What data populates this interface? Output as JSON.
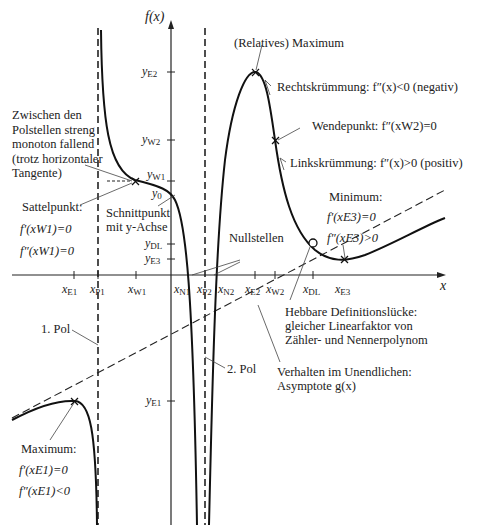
{
  "axes": {
    "y_axis_label": "f(x)",
    "x_axis_label": "x"
  },
  "y_ticks": [
    {
      "id": "yE2",
      "main": "y",
      "sub": "E2"
    },
    {
      "id": "yW2",
      "main": "y",
      "sub": "W2"
    },
    {
      "id": "yW1",
      "main": "y",
      "sub": "W1"
    },
    {
      "id": "y0",
      "main": "y",
      "sub": "0"
    },
    {
      "id": "yDL",
      "main": "y",
      "sub": "DL"
    },
    {
      "id": "yE3",
      "main": "y",
      "sub": "E3"
    },
    {
      "id": "yE1",
      "main": "y",
      "sub": "E1"
    }
  ],
  "x_ticks": [
    {
      "id": "xE1",
      "main": "x",
      "sub": "E1"
    },
    {
      "id": "xP1",
      "main": "x",
      "sub": "P1"
    },
    {
      "id": "xW1",
      "main": "x",
      "sub": "W1"
    },
    {
      "id": "xN1",
      "main": "x",
      "sub": "N1"
    },
    {
      "id": "xP2",
      "main": "x",
      "sub": "P2"
    },
    {
      "id": "xN2",
      "main": "x",
      "sub": "N2"
    },
    {
      "id": "xE2",
      "main": "x",
      "sub": "E2"
    },
    {
      "id": "xW2",
      "main": "x",
      "sub": "W2"
    },
    {
      "id": "xDL",
      "main": "x",
      "sub": "DL"
    },
    {
      "id": "xE3",
      "main": "x",
      "sub": "E3"
    }
  ],
  "annotations": {
    "rel_maximum": "(Relatives) Maximum",
    "rechtskruemmung": "Rechtskrümmung: f″(x)<0 (negativ)",
    "wendepunkt": "Wendepunkt: f″(xW2)=0",
    "linkskruemmung": "Linkskrümmung: f″(x)>0 (positiv)",
    "polstellen_monoton": "Zwischen den\nPolstellen streng\nmonoton fallend\n(trotz horizontaler\nTangente)",
    "sattelpunkt_title": "Sattelpunkt:",
    "sattelpunkt_f1": "f′(xW1)=0",
    "sattelpunkt_f2": "f″(xW1)=0",
    "schnittpunkt": "Schnittpunkt\nmit y-Achse",
    "nullstellen": "Nullstellen",
    "minimum_title": "Minimum:",
    "minimum_f1": "f′(xE3)=0",
    "minimum_f2": "f″(xE3)>0",
    "hebbare_luecke": "Hebbare Definitionslücke:\ngleicher Linearfaktor von\nZähler- und Nennerpolynom",
    "pol1": "1. Pol",
    "pol2": "2. Pol",
    "unendlich": "Verhalten im Unendlichen:\nAsymptote g(x)",
    "maximum_title": "Maximum:",
    "maximum_f1": "f′(xE1)=0",
    "maximum_f2": "f″(xE1)<0"
  }
}
